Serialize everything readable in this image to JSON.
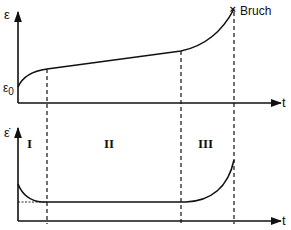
{
  "upper_plot": {
    "y_label": "ε",
    "y0_label": "ε",
    "y0_subscript": "0",
    "x_label": "t",
    "failure_marker": "×",
    "failure_label": "Bruch",
    "curve": "creep strain vs time: primary (decelerating), secondary (linear), tertiary (accelerating) to rupture"
  },
  "lower_plot": {
    "y_label": "ε̇",
    "x_label": "t",
    "stages": [
      "I",
      "II",
      "III"
    ],
    "curve": "creep rate vs time: decreasing, constant minimum, increasing"
  },
  "stage_boundaries_x_px": [
    47,
    181,
    234
  ],
  "colors": {
    "line": "#111111",
    "background": "#ffffff"
  }
}
